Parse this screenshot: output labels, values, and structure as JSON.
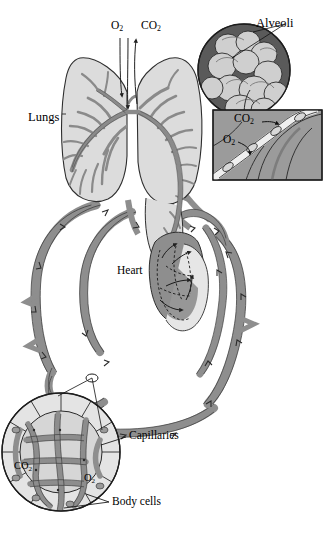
{
  "figure": {
    "background_color": "#ffffff",
    "width": 326,
    "height": 541
  },
  "palette": {
    "vessel_fill": "#8e8e8e",
    "vessel_stroke": "#3a3a3a",
    "lung_fill": "#dcdcdc",
    "lung_stroke": "#2e2e2e",
    "bronchi_fill": "#9a9a9a",
    "alveoli_circle_bg": "#5a5a5a",
    "alveoli_sac_fill": "#cfcfcf",
    "inset_bg": "#9b9b9b",
    "capillary_cell_fill": "#d6d6d6",
    "capillary_vessel_fill": "#8e8e8e",
    "heart_fill": "#8e8e8e",
    "heart_chamber_fill": "#e2e2e2",
    "label_color": "#000000",
    "leader_line_color": "#111111"
  },
  "labels": {
    "lungs": "Lungs",
    "heart": "Heart",
    "alveoli": "Alveoli",
    "capillaries": "Capillaries",
    "body_cells": "Body cells",
    "oxygen_top": "O",
    "oxygen_sub": "2",
    "carbon_dioxide_top": "CO",
    "carbon_dioxide_sub": "2"
  },
  "gas_labels": {
    "lung_intake_o2": {
      "text": "O2",
      "base": "O",
      "sub": "2",
      "x": 113,
      "y": 26,
      "meaning": "oxygen inhaled into lungs"
    },
    "lung_output_co2": {
      "text": "CO2",
      "base": "CO",
      "sub": "2",
      "x": 145,
      "y": 26,
      "meaning": "carbon dioxide exhaled from lungs"
    },
    "inset_co2": {
      "text": "CO2",
      "base": "CO",
      "sub": "2",
      "x": 235,
      "y": 118,
      "meaning": "carbon dioxide diffusing out of blood into alveolus"
    },
    "inset_o2": {
      "text": "O2",
      "base": "O",
      "sub": "2",
      "x": 224,
      "y": 140,
      "meaning": "oxygen diffusing from alveolus into blood"
    },
    "tissue_co2": {
      "text": "CO2",
      "base": "CO",
      "sub": "2",
      "x": 15,
      "y": 466,
      "meaning": "carbon dioxide leaving body cells"
    },
    "tissue_o2": {
      "text": "O2",
      "base": "O",
      "sub": "2",
      "x": 84,
      "y": 478,
      "meaning": "oxygen entering body cells"
    }
  },
  "callouts": [
    {
      "name": "alveoli",
      "label": "Alveoli",
      "label_x": 258,
      "label_y": 24,
      "target_x": 232,
      "target_y": 58
    },
    {
      "name": "capillaries",
      "label": "Capillaries",
      "label_x": 129,
      "label_y": 432,
      "target_x": 60,
      "target_y": 444
    },
    {
      "name": "body-cells",
      "label": "Body cells",
      "label_x": 112,
      "label_y": 499,
      "target_x": 52,
      "target_y": 505
    }
  ],
  "anatomy": {
    "lungs": {
      "label": "Lungs",
      "label_x": 28,
      "label_y": 118,
      "count": 2
    },
    "heart": {
      "label": "Heart",
      "label_x": 118,
      "label_y": 271
    },
    "alveoli_inset": {
      "shape": "circle",
      "cx": 244,
      "cy": 70,
      "r": 46
    },
    "gas_exchange_inset": {
      "shape": "rect",
      "x": 213,
      "y": 110,
      "w": 109,
      "h": 70
    },
    "capillary_inset": {
      "shape": "circle",
      "cx": 61,
      "cy": 452,
      "r": 59
    }
  },
  "flow": {
    "arrow_marker_count": 26,
    "description": "Arrowheads along vessels indicate direction of blood flow through pulmonary and systemic circuits"
  }
}
